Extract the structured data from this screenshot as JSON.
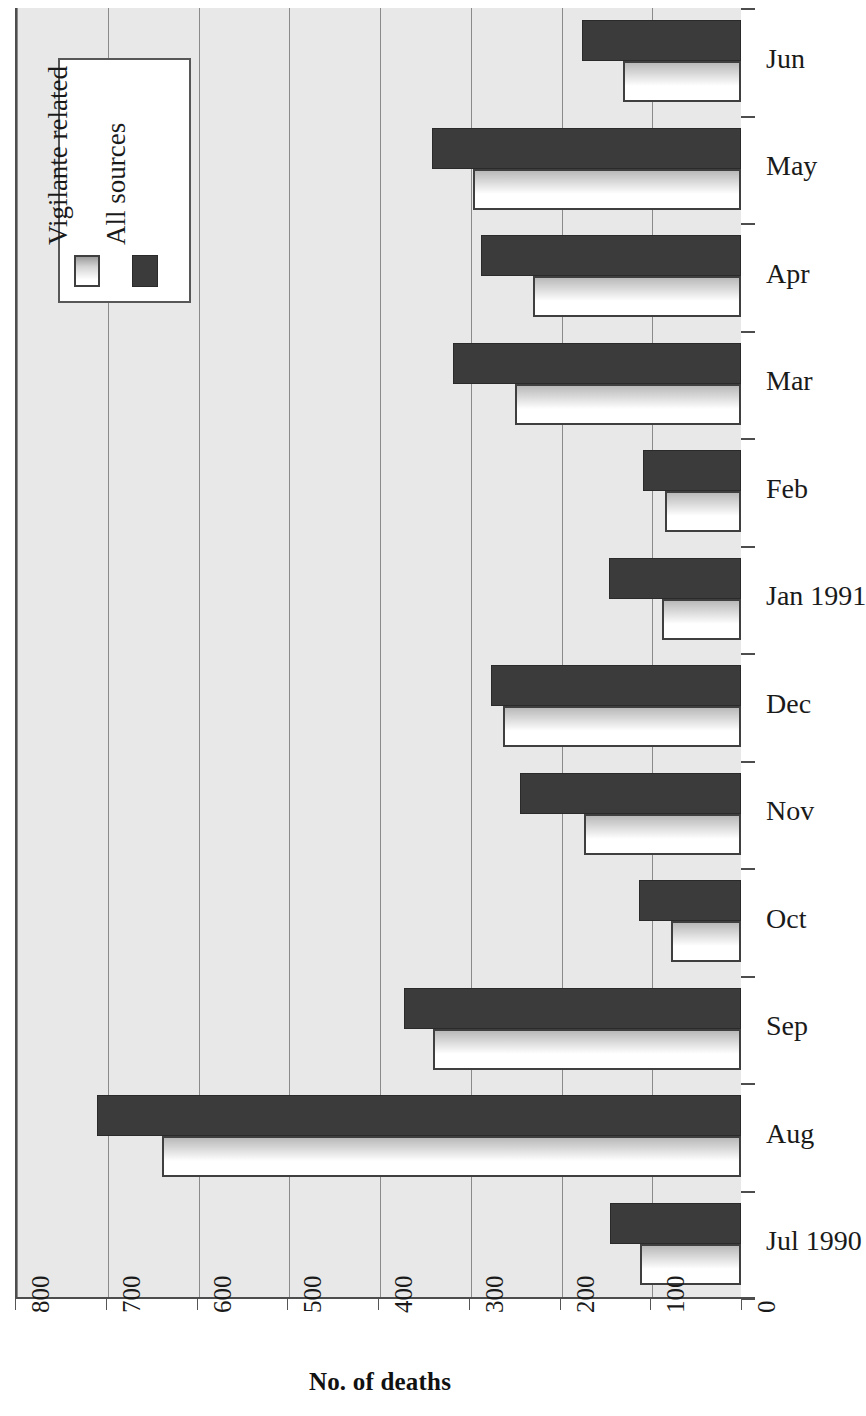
{
  "chart_data": {
    "type": "bar",
    "orientation": "horizontal",
    "title": "",
    "xlabel": "No. of deaths",
    "ylabel": "",
    "xlim": [
      0,
      800
    ],
    "x_axis_reversed": true,
    "xticks": [
      800,
      700,
      600,
      500,
      400,
      300,
      200,
      100,
      0
    ],
    "xtick_labels": [
      "800",
      "700",
      "600",
      "500",
      "400",
      "300",
      "200",
      "100",
      "0"
    ],
    "grid": "vertical",
    "categories": [
      "Jun",
      "May",
      "Apr",
      "Mar",
      "Feb",
      "Jan 1991",
      "Dec",
      "Nov",
      "Oct",
      "Sep",
      "Aug",
      "Jul 1990"
    ],
    "series": [
      {
        "name": "All sources",
        "color": "#3b3b3b",
        "values": [
          175,
          340,
          286,
          317,
          108,
          145,
          276,
          243,
          112,
          371,
          710,
          144
        ]
      },
      {
        "name": "Vigilante related",
        "color": "#ffffff",
        "values": [
          130,
          295,
          229,
          249,
          84,
          87,
          262,
          173,
          77,
          339,
          638,
          111
        ]
      }
    ],
    "legend": {
      "position": "top-left",
      "entries": [
        "Vigilante related",
        "All sources"
      ]
    }
  },
  "legend": {
    "vigilante_label": "Vigilante related",
    "all_sources_label": "All sources"
  },
  "axis": {
    "title": "No. of deaths"
  },
  "colors": {
    "plot_background": "#e8e8e8",
    "dark_bar": "#3b3b3b",
    "light_bar": "#ffffff",
    "gridline": "#8a8a8a",
    "axis": "#4d4d4d"
  }
}
